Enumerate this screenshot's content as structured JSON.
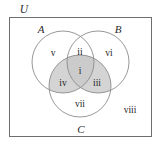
{
  "diagram": {
    "title_label": "U",
    "universe": {
      "label": "U",
      "border_color": "#6e6e6e",
      "fill_color": "#ffffff"
    },
    "sets": [
      {
        "key": "A",
        "label": "A",
        "cx": 63,
        "cy": 62,
        "r": 31
      },
      {
        "key": "B",
        "label": "B",
        "cx": 98,
        "cy": 62,
        "r": 31
      },
      {
        "key": "C",
        "label": "C",
        "cx": 80,
        "cy": 86,
        "r": 31
      }
    ],
    "set_label_positions": [
      {
        "key": "A",
        "label": "A",
        "x": 41,
        "y": 33
      },
      {
        "key": "B",
        "label": "B",
        "x": 118,
        "y": 33
      },
      {
        "key": "C",
        "label": "C",
        "x": 81,
        "y": 131
      }
    ],
    "regions": [
      {
        "id": "i",
        "label": "i",
        "x": 80,
        "y": 71,
        "description": "A and B and C",
        "shaded": true
      },
      {
        "id": "ii",
        "label": "ii",
        "x": 80,
        "y": 52,
        "description": "A and B not C",
        "shaded": false
      },
      {
        "id": "iii",
        "label": "iii",
        "x": 97,
        "y": 83,
        "description": "B and C not A",
        "shaded": true
      },
      {
        "id": "iv",
        "label": "iv",
        "x": 63,
        "y": 83,
        "description": "A and C not B",
        "shaded": true
      },
      {
        "id": "v",
        "label": "v",
        "x": 53,
        "y": 53,
        "description": "A only",
        "shaded": false
      },
      {
        "id": "vi",
        "label": "vi",
        "x": 108,
        "y": 53,
        "description": "B only",
        "shaded": false
      },
      {
        "id": "vii",
        "label": "vii",
        "x": 80,
        "y": 104,
        "description": "C only",
        "shaded": false
      },
      {
        "id": "viii",
        "label": "viii",
        "x": 129,
        "y": 110,
        "description": "outside all sets",
        "shaded": false
      }
    ],
    "colors": {
      "shade_fill": "#d4d4d4",
      "shade_fill_dark": "#c4c4c4",
      "circle_stroke": "#8c8c8c",
      "rect_stroke": "#6e6e6e",
      "text": "#1e1e1e",
      "background": "#ffffff"
    },
    "shaded_description": "C intersect (A union B)"
  }
}
